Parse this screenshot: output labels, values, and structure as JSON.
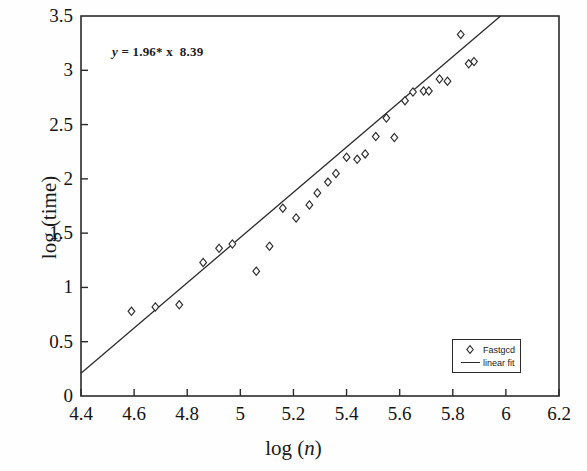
{
  "chart_data": {
    "type": "scatter",
    "title": "",
    "xlabel": "log (n)",
    "ylabel": "log (time)",
    "xlim": [
      4.4,
      6.2
    ],
    "ylim": [
      0,
      3.5
    ],
    "xticks": [
      "4.4",
      "4.6",
      "4.8",
      "5",
      "5.2",
      "5.4",
      "5.6",
      "5.8",
      "6",
      "6.2"
    ],
    "yticks": [
      "0",
      "0.5",
      "1",
      "1.5",
      "2",
      "2.5",
      "3",
      "3.5"
    ],
    "grid": false,
    "legend_position": "lower-right",
    "annotation": "y = 1.96* x  8.39",
    "annotation_slope": 1.96,
    "annotation_intercept": -8.39,
    "series": [
      {
        "name": "Fastgcd",
        "type": "scatter",
        "marker": "diamond",
        "color": "#2b2b2b",
        "points": [
          [
            4.59,
            0.78
          ],
          [
            4.68,
            0.82
          ],
          [
            4.77,
            0.84
          ],
          [
            4.86,
            1.23
          ],
          [
            4.92,
            1.36
          ],
          [
            4.97,
            1.4
          ],
          [
            5.06,
            1.15
          ],
          [
            5.11,
            1.38
          ],
          [
            5.16,
            1.73
          ],
          [
            5.21,
            1.64
          ],
          [
            5.26,
            1.76
          ],
          [
            5.29,
            1.87
          ],
          [
            5.33,
            1.97
          ],
          [
            5.36,
            2.05
          ],
          [
            5.4,
            2.2
          ],
          [
            5.44,
            2.18
          ],
          [
            5.47,
            2.23
          ],
          [
            5.51,
            2.39
          ],
          [
            5.55,
            2.56
          ],
          [
            5.58,
            2.38
          ],
          [
            5.62,
            2.72
          ],
          [
            5.65,
            2.8
          ],
          [
            5.69,
            2.81
          ],
          [
            5.71,
            2.81
          ],
          [
            5.75,
            2.92
          ],
          [
            5.78,
            2.9
          ],
          [
            5.83,
            3.33
          ],
          [
            5.86,
            3.06
          ],
          [
            5.88,
            3.08
          ]
        ]
      },
      {
        "name": "linear fit",
        "type": "line",
        "color": "#2b2b2b",
        "endpoints": [
          [
            4.4,
            0.21
          ],
          [
            5.98,
            3.5
          ]
        ]
      }
    ]
  },
  "legend": {
    "items": [
      {
        "label": "Fastgcd",
        "key": "diamond-marker"
      },
      {
        "label": "linear fit",
        "key": "line-segment"
      }
    ]
  },
  "annotation": {
    "lhs": "y",
    "body": " = 1.96* x  8.39"
  },
  "axes": {
    "x_label_prefix": "log (",
    "x_label_var": "n",
    "x_label_suffix": ")",
    "y_label": "log (time)"
  }
}
